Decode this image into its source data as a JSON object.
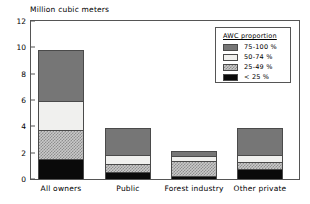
{
  "chart_data": {
    "type": "bar",
    "title": "",
    "ylabel": "Million cubic meters",
    "xlabel": "",
    "ylim": [
      0,
      12
    ],
    "yticks": [
      0,
      2,
      4,
      6,
      8,
      10,
      12
    ],
    "grid": false,
    "stacked": true,
    "legend_position": "top-right",
    "legend_title": "AWC proportion",
    "categories": [
      "All owners",
      "Public",
      "Forest industry",
      "Other private"
    ],
    "series": [
      {
        "name": "< 25 %",
        "key": "lt25",
        "color": "#0a0a0a",
        "values": [
          1.45,
          0.45,
          0.15,
          0.7
        ]
      },
      {
        "name": "25-49 %",
        "key": "25-49",
        "color": "#c9c9c9",
        "values": [
          2.25,
          0.65,
          1.2,
          0.55
        ]
      },
      {
        "name": "50-74 %",
        "key": "50-74",
        "color": "#f0f0ee",
        "values": [
          2.2,
          0.65,
          0.4,
          0.55
        ]
      },
      {
        "name": "75-100 %",
        "key": "75-100",
        "color": "#767676",
        "values": [
          3.9,
          2.1,
          0.35,
          2.05
        ]
      }
    ],
    "totals": [
      9.8,
      3.85,
      2.1,
      3.85
    ]
  },
  "legend": {
    "title": "AWC proportion",
    "entries": [
      {
        "label": "75-100 %"
      },
      {
        "label": "50-74 %"
      },
      {
        "label": "25-49 %"
      },
      {
        "label": "< 25 %"
      }
    ]
  },
  "axis": {
    "y_title": "Million cubic meters",
    "y_ticks": [
      "12",
      "10",
      "8",
      "6",
      "4",
      "2",
      "0"
    ],
    "x_labels": [
      "All owners",
      "Public",
      "Forest industry",
      "Other private"
    ]
  }
}
